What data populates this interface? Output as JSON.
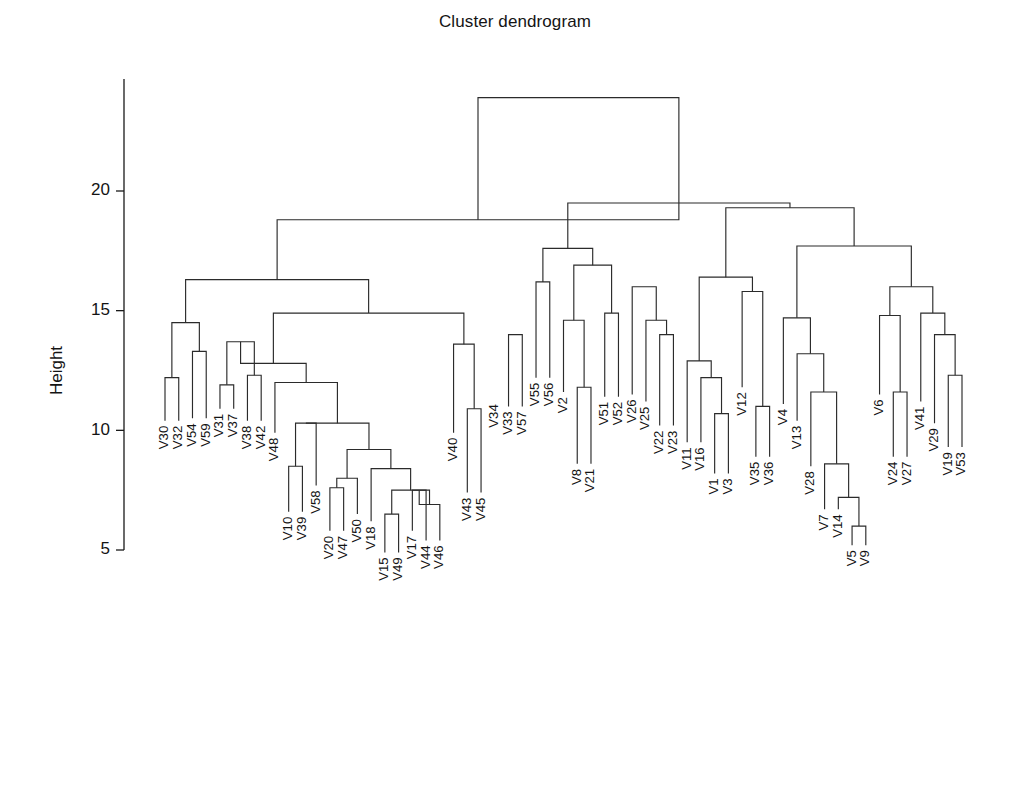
{
  "chart_data": {
    "type": "dendrogram",
    "title": "Cluster dendrogram",
    "xlabel": "",
    "ylabel": "Height",
    "ylim": [
      4.2,
      24.4
    ],
    "yticks": [
      5,
      10,
      15,
      20
    ],
    "ytick_labels": [
      "5",
      "10",
      "15",
      "20"
    ],
    "grid": false,
    "legend": null,
    "n_leaves": 59,
    "leaf_order": [
      "V30",
      "V32",
      "V54",
      "V59",
      "V31",
      "V37",
      "V38",
      "V42",
      "V48",
      "V10",
      "V39",
      "V58",
      "V20",
      "V47",
      "V50",
      "V18",
      "V15",
      "V49",
      "V17",
      "V44",
      "V46",
      "V40",
      "V43",
      "V45",
      "V34",
      "V33",
      "V57",
      "V55",
      "V56",
      "V2",
      "V8",
      "V21",
      "V51",
      "V52",
      "V26",
      "V25",
      "V22",
      "V23",
      "V11",
      "V16",
      "V1",
      "V3",
      "V12",
      "V35",
      "V36",
      "V4",
      "V13",
      "V28",
      "V7",
      "V14",
      "V5",
      "V9",
      "V6",
      "V24",
      "V27",
      "V41",
      "V29",
      "V19",
      "V53"
    ],
    "leaf_heights": [
      10.4,
      10.4,
      10.5,
      10.5,
      10.9,
      10.9,
      10.4,
      10.4,
      9.9,
      6.6,
      6.6,
      7.7,
      5.8,
      5.8,
      6.5,
      6.2,
      4.9,
      4.9,
      5.8,
      5.4,
      5.4,
      9.9,
      7.4,
      7.4,
      11.3,
      11.0,
      11.0,
      12.2,
      12.2,
      11.6,
      8.6,
      8.6,
      11.4,
      11.4,
      11.5,
      11.2,
      10.2,
      10.2,
      9.5,
      9.5,
      8.2,
      8.2,
      11.8,
      8.9,
      8.9,
      11.1,
      10.4,
      8.5,
      6.7,
      6.7,
      5.2,
      5.2,
      11.5,
      8.9,
      8.9,
      11.2,
      10.3,
      9.3,
      9.3
    ],
    "merges": [
      {
        "id": "m1",
        "left": "V30",
        "right": "V32",
        "height": 12.2
      },
      {
        "id": "m2",
        "left": "V54",
        "right": "V59",
        "height": 13.3
      },
      {
        "id": "m3",
        "left": "m1",
        "right": "m2",
        "height": 14.5
      },
      {
        "id": "m4",
        "left": "V31",
        "right": "V37",
        "height": 11.9
      },
      {
        "id": "m5",
        "left": "V38",
        "right": "V42",
        "height": 12.3
      },
      {
        "id": "m6",
        "left": "m4",
        "right": "m5",
        "height": 13.7
      },
      {
        "id": "m7",
        "left": "V10",
        "right": "V39",
        "height": 8.5
      },
      {
        "id": "m8",
        "left": "V20",
        "right": "V47",
        "height": 7.6
      },
      {
        "id": "m9",
        "left": "m8",
        "right": "V50",
        "height": 8.0
      },
      {
        "id": "m10",
        "left": "V15",
        "right": "V49",
        "height": 6.5
      },
      {
        "id": "m11",
        "left": "V17",
        "right": "V44",
        "height": 7.5
      },
      {
        "id": "m12",
        "left": "m11",
        "right": "V46",
        "height": 6.9
      },
      {
        "id": "m13",
        "left": "m10",
        "right": "m12",
        "height": 7.5
      },
      {
        "id": "m14",
        "left": "V18",
        "right": "m13",
        "height": 8.4
      },
      {
        "id": "m15",
        "left": "m9",
        "right": "m14",
        "height": 9.2
      },
      {
        "id": "m16",
        "left": "m7",
        "right": "V58",
        "height": 10.3
      },
      {
        "id": "m17",
        "left": "m16",
        "right": "m15",
        "height": 10.3
      },
      {
        "id": "m18",
        "left": "V48",
        "right": "m17",
        "height": 12.0
      },
      {
        "id": "m19",
        "left": "m6",
        "right": "m18",
        "height": 12.8
      },
      {
        "id": "m20",
        "left": "V43",
        "right": "V45",
        "height": 10.9
      },
      {
        "id": "m21",
        "left": "V40",
        "right": "m20",
        "height": 13.6
      },
      {
        "id": "m22",
        "left": "m19",
        "right": "m21",
        "height": 14.9
      },
      {
        "id": "m23",
        "left": "m3",
        "right": "m22",
        "height": 16.3
      },
      {
        "id": "m24",
        "left": "V33",
        "right": "V57",
        "height": 14.0
      },
      {
        "id": "m25",
        "left": "V55",
        "right": "V56",
        "height": 16.2
      },
      {
        "id": "m26",
        "left": "V51",
        "right": "V52",
        "height": 14.9
      },
      {
        "id": "m27",
        "left": "V8",
        "right": "V21",
        "height": 11.8
      },
      {
        "id": "m28",
        "left": "V2",
        "right": "m27",
        "height": 14.6
      },
      {
        "id": "m29",
        "left": "m28",
        "right": "m26",
        "height": 16.9
      },
      {
        "id": "m30",
        "left": "m25",
        "right": "m29",
        "height": 17.6
      },
      {
        "id": "m31",
        "left": "V22",
        "right": "V23",
        "height": 14.0
      },
      {
        "id": "m32",
        "left": "V25",
        "right": "m31",
        "height": 14.6
      },
      {
        "id": "m33",
        "left": "V26",
        "right": "m32",
        "height": 16.0
      },
      {
        "id": "m34",
        "left": "V1",
        "right": "V3",
        "height": 10.7
      },
      {
        "id": "m35",
        "left": "V16",
        "right": "m34",
        "height": 12.2
      },
      {
        "id": "m36",
        "left": "V11",
        "right": "m35",
        "height": 12.9
      },
      {
        "id": "m37",
        "left": "V35",
        "right": "V36",
        "height": 11.0
      },
      {
        "id": "m38",
        "left": "V12",
        "right": "m37",
        "height": 15.8
      },
      {
        "id": "m39",
        "left": "m36",
        "right": "m38",
        "height": 16.4
      },
      {
        "id": "m40",
        "left": "V5",
        "right": "V9",
        "height": 6.0
      },
      {
        "id": "m41",
        "left": "V14",
        "right": "m40",
        "height": 7.2
      },
      {
        "id": "m42",
        "left": "V7",
        "right": "m41",
        "height": 8.6
      },
      {
        "id": "m43",
        "left": "V28",
        "right": "m42",
        "height": 11.6
      },
      {
        "id": "m44",
        "left": "V13",
        "right": "m43",
        "height": 13.2
      },
      {
        "id": "m45",
        "left": "V4",
        "right": "m44",
        "height": 14.7
      },
      {
        "id": "m46",
        "left": "V24",
        "right": "V27",
        "height": 11.6
      },
      {
        "id": "m47",
        "left": "V6",
        "right": "m46",
        "height": 14.8
      },
      {
        "id": "m48",
        "left": "V19",
        "right": "V53",
        "height": 12.3
      },
      {
        "id": "m49",
        "left": "V29",
        "right": "m48",
        "height": 14.0
      },
      {
        "id": "m50",
        "left": "V41",
        "right": "m49",
        "height": 14.9
      },
      {
        "id": "m51",
        "left": "m47",
        "right": "m50",
        "height": 16.0
      },
      {
        "id": "m52",
        "left": "m45",
        "right": "m51",
        "height": 17.7
      },
      {
        "id": "m53",
        "left": "m39",
        "right": "m52",
        "height": 19.3
      },
      {
        "id": "m54",
        "left": "m30",
        "right": "m53",
        "height": 19.5
      },
      {
        "id": "m55",
        "left": "m23",
        "right": "m54",
        "height": 18.8
      },
      {
        "id": "m56",
        "left": "m55",
        "right": "__root_right__",
        "height": 23.9
      }
    ],
    "root": {
      "left_x_leaf_index": 11.5,
      "right_x_leaf_index": 35.5,
      "height": 23.9
    },
    "colors": {
      "line": "#2b2b2b",
      "text": "#141414",
      "background": "#ffffff"
    }
  },
  "geometry": {
    "plot_left": 165,
    "plot_right": 962,
    "axis_x": 124,
    "y_at_5": 550,
    "y_at_20": 191,
    "axis_top_y": 79,
    "axis_bottom_y": 550,
    "label_gap": 5,
    "leaf_spacing": 13.74
  }
}
